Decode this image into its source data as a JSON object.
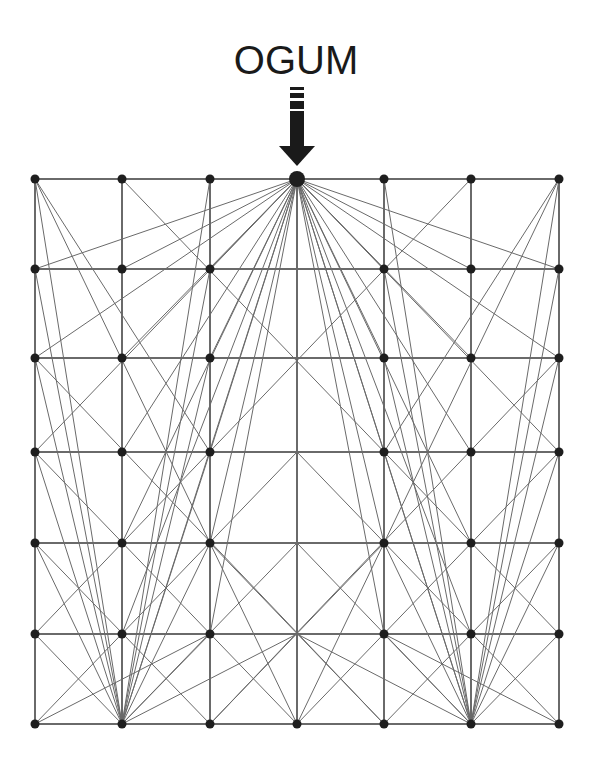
{
  "title": "OGUM",
  "colors": {
    "line": "#6a6a6a",
    "node": "#1e1e1e",
    "arrow": "#1a1a1a",
    "text": "#1a1a1a"
  },
  "grid": {
    "cols": [
      35,
      122,
      210,
      297,
      384,
      471,
      559
    ],
    "rows": [
      179,
      269,
      358,
      452,
      543,
      634,
      724
    ]
  },
  "hub": {
    "col": 3,
    "row": 0,
    "label": "OGUM",
    "icon": "down-arrow-icon"
  },
  "fan_targets_from_hub": [
    [
      0,
      1
    ],
    [
      1,
      1
    ],
    [
      2,
      1
    ],
    [
      4,
      1
    ],
    [
      5,
      1
    ],
    [
      6,
      1
    ],
    [
      0,
      2
    ],
    [
      1,
      2
    ],
    [
      2,
      2
    ],
    [
      4,
      2
    ],
    [
      5,
      2
    ],
    [
      6,
      2
    ],
    [
      0,
      3
    ],
    [
      1,
      3
    ],
    [
      2,
      3
    ],
    [
      4,
      3
    ],
    [
      5,
      3
    ],
    [
      6,
      3
    ],
    [
      1,
      4
    ],
    [
      2,
      4
    ],
    [
      4,
      4
    ],
    [
      5,
      4
    ],
    [
      1,
      5
    ],
    [
      2,
      5
    ],
    [
      4,
      5
    ],
    [
      5,
      5
    ],
    [
      1,
      6
    ],
    [
      5,
      6
    ],
    [
      3,
      6
    ]
  ],
  "bottom_hubs": [
    {
      "col": 1,
      "row": 6,
      "targets": [
        [
          0,
          0
        ],
        [
          2,
          0
        ],
        [
          0,
          1
        ],
        [
          2,
          1
        ],
        [
          0,
          2
        ],
        [
          2,
          2
        ],
        [
          0,
          3
        ],
        [
          2,
          3
        ],
        [
          0,
          4
        ],
        [
          2,
          4
        ],
        [
          3,
          4
        ],
        [
          0,
          5
        ],
        [
          2,
          5
        ],
        [
          3,
          5
        ],
        [
          0,
          6
        ]
      ]
    },
    {
      "col": 5,
      "row": 6,
      "targets": [
        [
          4,
          0
        ],
        [
          6,
          0
        ],
        [
          4,
          1
        ],
        [
          6,
          1
        ],
        [
          4,
          2
        ],
        [
          6,
          2
        ],
        [
          4,
          3
        ],
        [
          6,
          3
        ],
        [
          4,
          4
        ],
        [
          6,
          4
        ],
        [
          3,
          4
        ],
        [
          4,
          5
        ],
        [
          6,
          5
        ],
        [
          3,
          5
        ],
        [
          6,
          6
        ]
      ]
    }
  ],
  "diagonals": [
    [
      [
        0,
        0
      ],
      [
        3,
        6
      ]
    ],
    [
      [
        6,
        0
      ],
      [
        3,
        6
      ]
    ],
    [
      [
        0,
        0
      ],
      [
        2,
        3
      ]
    ],
    [
      [
        6,
        0
      ],
      [
        4,
        3
      ]
    ],
    [
      [
        0,
        3
      ],
      [
        3,
        6
      ]
    ],
    [
      [
        6,
        3
      ],
      [
        3,
        6
      ]
    ],
    [
      [
        0,
        6
      ],
      [
        3,
        3
      ]
    ],
    [
      [
        6,
        6
      ],
      [
        3,
        3
      ]
    ],
    [
      [
        0,
        4
      ],
      [
        2,
        6
      ]
    ],
    [
      [
        6,
        4
      ],
      [
        4,
        6
      ]
    ],
    [
      [
        2,
        4
      ],
      [
        4,
        6
      ]
    ],
    [
      [
        4,
        4
      ],
      [
        2,
        6
      ]
    ],
    [
      [
        0,
        2
      ],
      [
        4,
        6
      ]
    ],
    [
      [
        6,
        2
      ],
      [
        2,
        6
      ]
    ],
    [
      [
        1,
        0
      ],
      [
        6,
        5
      ]
    ],
    [
      [
        5,
        0
      ],
      [
        0,
        5
      ]
    ],
    [
      [
        0,
        6
      ],
      [
        2,
        5
      ]
    ],
    [
      [
        6,
        6
      ],
      [
        4,
        5
      ]
    ]
  ]
}
